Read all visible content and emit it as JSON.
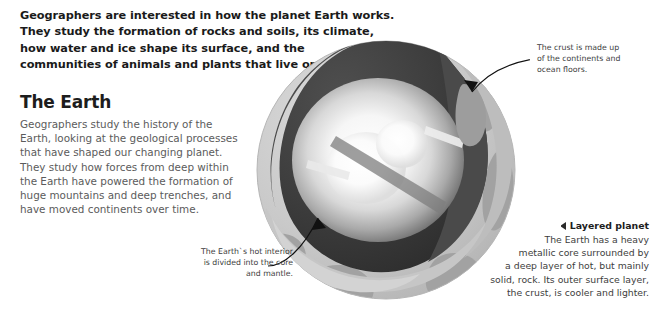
{
  "intro": {
    "lines": [
      "Geographers are interested in how the planet Earth works.",
      "They study the formation of rocks and soils, its climate,",
      "how water and ice shape its surface, and the",
      "communities of animals and plants that live on it."
    ]
  },
  "section": {
    "title": "The Earth",
    "body_lines": [
      "Geographers study the history of the",
      "Earth, looking at the geological processes",
      "that have shaped our changing planet.",
      "They study how forces from deep within",
      "the Earth have powered the formation of",
      "huge mountains and deep trenches, and",
      "have moved continents over time."
    ]
  },
  "callouts": {
    "crust": {
      "lines": [
        "The crust is made up",
        "of the continents and",
        "ocean floors."
      ]
    },
    "interior": {
      "lines": [
        "The Earth`s hot interior",
        "is divided into the core",
        "and mantle."
      ]
    }
  },
  "layered_planet": {
    "marker_icon": "triangle-left-icon",
    "heading": "Layered planet",
    "body_lines": [
      "The Earth has a heavy",
      "metallic core surrounded by",
      "a deep layer of hot, but mainly",
      "solid, rock. Its outer surface layer,",
      "the crust, is cooler and lighter."
    ]
  },
  "illustration": {
    "name": "earth-cutaway-diagram",
    "alt": "Cutaway diagram of planet Earth showing crust, mantle and glowing core",
    "colors": {
      "ocean": "#c8c8c8",
      "continent": "#a0a0a0",
      "crust_band": "#b4b4b4",
      "mantle_dark": "#3a3a3a",
      "mantle_mid": "#4e4e4e",
      "core_glow": "#f2f2f2",
      "inner_core": "#ffffff",
      "leader_line": "#111111"
    }
  }
}
